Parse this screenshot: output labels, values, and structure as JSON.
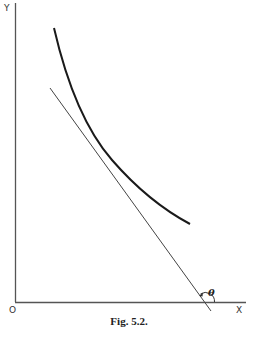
{
  "figure": {
    "caption": "Fig. 5.2.",
    "axes": {
      "y_label": "Y",
      "x_label": "X",
      "origin_label": "O"
    },
    "angle_label": "θ",
    "elements": [
      {
        "name": "convex decreasing curve",
        "type": "curve"
      },
      {
        "name": "tangent line at point on curve",
        "type": "line"
      },
      {
        "name": "angle θ between tangent and x-axis",
        "type": "arc"
      }
    ],
    "colors": {
      "axis": "#555555",
      "curve": "#1a1a1a",
      "tangent": "#444444",
      "text": "#222222"
    }
  }
}
